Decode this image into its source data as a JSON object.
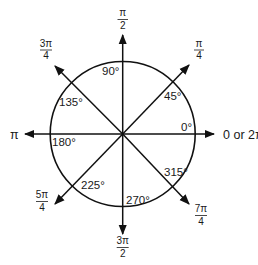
{
  "diagram": {
    "type": "unit-circle-angles",
    "center": {
      "x": 122.7,
      "y": 134
    },
    "radius": 72.5,
    "stroke_color": "#111111",
    "background": "#ffffff",
    "rays": [
      {
        "angle_deg": 0,
        "degree_label": "0°",
        "radian_label": "0 or 2π"
      },
      {
        "angle_deg": 45,
        "degree_label": "45°",
        "radian_label": {
          "num": "π",
          "den": "4"
        }
      },
      {
        "angle_deg": 90,
        "degree_label": "90°",
        "radian_label": {
          "num": "π",
          "den": "2"
        }
      },
      {
        "angle_deg": 135,
        "degree_label": "135°",
        "radian_label": {
          "num": "3π",
          "den": "4"
        }
      },
      {
        "angle_deg": 180,
        "degree_label": "180°",
        "radian_label": "π"
      },
      {
        "angle_deg": 225,
        "degree_label": "225°",
        "radian_label": {
          "num": "5π",
          "den": "4"
        }
      },
      {
        "angle_deg": 270,
        "degree_label": "270°",
        "radian_label": {
          "num": "3π",
          "den": "2"
        }
      },
      {
        "angle_deg": 315,
        "degree_label": "315°",
        "radian_label": {
          "num": "7π",
          "den": "4"
        }
      }
    ]
  },
  "labels": {
    "deg0": "0°",
    "deg45": "45°",
    "deg90": "90°",
    "deg135": "135°",
    "deg180": "180°",
    "deg225": "225°",
    "deg270": "270°",
    "deg315": "315°",
    "rad0": "0 or 2π",
    "rad45_num": "π",
    "rad45_den": "4",
    "rad90_num": "π",
    "rad90_den": "2",
    "rad135_num": "3π",
    "rad135_den": "4",
    "rad180": "π",
    "rad225_num": "5π",
    "rad225_den": "4",
    "rad270_num": "3π",
    "rad270_den": "2",
    "rad315_num": "7π",
    "rad315_den": "4"
  }
}
